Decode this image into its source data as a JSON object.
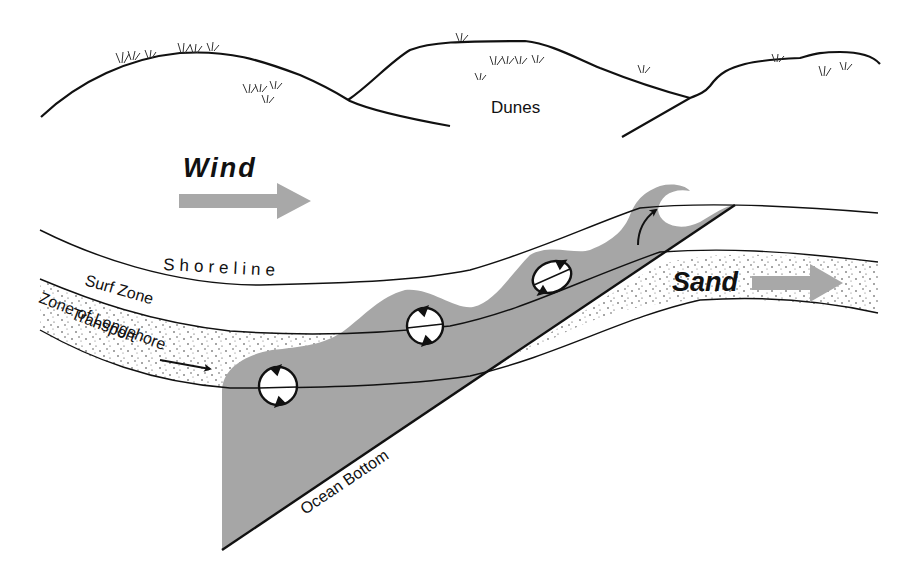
{
  "diagram": {
    "type": "longshore-transport-illustration",
    "labels": {
      "dunes": "Dunes",
      "wind": "Wind",
      "shoreline": "Shoreline",
      "surf_zone": "Surf Zone",
      "zone_line1": "Zone of Longshore",
      "zone_line2": "Transport",
      "sand": "Sand",
      "ocean_bottom": "Ocean Bottom"
    },
    "colors": {
      "ink": "#111111",
      "water_gray": "#a6a6a6",
      "arrow_gray": "#a8a8a8",
      "background": "#ffffff"
    },
    "arrows": [
      {
        "name": "wind-arrow",
        "direction": "right"
      },
      {
        "name": "sand-arrow",
        "direction": "right"
      },
      {
        "name": "transport-arrow",
        "direction": "right"
      },
      {
        "name": "wave-break-arrow",
        "direction": "up-right"
      }
    ],
    "rotation_markers": 4
  }
}
